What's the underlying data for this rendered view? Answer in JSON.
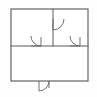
{
  "document": {
    "kind": "architectural-floor-plan-thumbnail",
    "title": "Floor Plan",
    "width_px": 97,
    "height_px": 97
  },
  "colors": {
    "background": "#fefefe",
    "wall_stroke": "#555555",
    "partition_stroke": "#5a5a5a",
    "door_stroke": "#6a6a6a",
    "room_fill": "#ffffff"
  },
  "plan": {
    "outline": {
      "label": "exterior-wall-outline",
      "x": 11,
      "y": 9,
      "width": 77,
      "height": 72,
      "stroke_width": 1.1
    },
    "partitions": [
      {
        "label": "horizontal-partition",
        "orientation": "horizontal",
        "x1": 11,
        "y1": 46,
        "x2": 88,
        "y2": 46
      },
      {
        "label": "vertical-partition",
        "orientation": "vertical",
        "x1": 53,
        "y1": 9,
        "x2": 53,
        "y2": 46
      }
    ],
    "rooms": [
      {
        "label": "upper-left-room",
        "x": 11,
        "y": 9,
        "width": 42,
        "height": 37
      },
      {
        "label": "upper-right-room",
        "x": 53,
        "y": 9,
        "width": 35,
        "height": 37
      },
      {
        "label": "lower-room",
        "x": 11,
        "y": 46,
        "width": 77,
        "height": 35
      }
    ],
    "doors": [
      {
        "label": "door-vertical-partition",
        "wall": "vertical-partition",
        "hinge_x": 53,
        "hinge_y": 19,
        "leaf_length": 11,
        "leaf_end_x": 53,
        "leaf_end_y": 30,
        "arc_end_x": 64,
        "arc_end_y": 19,
        "swing": "clockwise-into-upper-right-room",
        "sweep_flag": 0
      },
      {
        "label": "door-upper-left-room",
        "wall": "horizontal-partition",
        "hinge_x": 31,
        "hinge_y": 46,
        "leaf_length": 10,
        "leaf_end_x": 41,
        "leaf_end_y": 46,
        "arc_end_x": 31,
        "arc_end_y": 36,
        "swing": "into-upper-left-room",
        "sweep_flag": 1,
        "jamb_x": 41,
        "jamb_y1": 46,
        "jamb_y2": 37
      },
      {
        "label": "door-upper-right-room",
        "wall": "horizontal-partition",
        "hinge_x": 70,
        "hinge_y": 46,
        "leaf_length": 10,
        "leaf_end_x": 80,
        "leaf_end_y": 46,
        "arc_end_x": 70,
        "arc_end_y": 36,
        "swing": "into-upper-right-room",
        "sweep_flag": 1,
        "jamb_x": 80,
        "jamb_y1": 46,
        "jamb_y2": 37
      },
      {
        "label": "door-exterior-bottom",
        "wall": "bottom-exterior-wall",
        "hinge_x": 39,
        "hinge_y": 81,
        "leaf_length": 10,
        "leaf_end_x": 39,
        "leaf_end_y": 91,
        "arc_end_x": 49,
        "arc_end_y": 81,
        "swing": "outward-below-building",
        "sweep_flag": 0,
        "jamb_x": 49,
        "jamb_y1": 81,
        "jamb_y2": 88
      }
    ]
  }
}
